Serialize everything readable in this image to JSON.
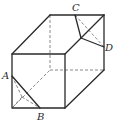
{
  "diagram": {
    "type": "cuboid-with-cut-corners",
    "labels": {
      "A": "A",
      "B": "B",
      "C": "C",
      "D": "D"
    },
    "colors": {
      "line": "#2a2a2a",
      "hidden_line": "#6a6a6a",
      "background": "#ffffff"
    }
  }
}
